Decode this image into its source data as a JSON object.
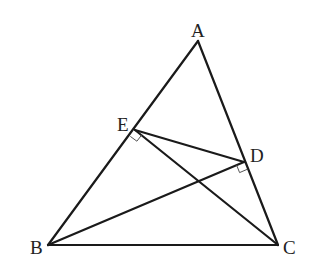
{
  "diagram": {
    "type": "geometry-triangle",
    "points": {
      "A": {
        "label": "A",
        "x": 198,
        "y": 41
      },
      "B": {
        "label": "B",
        "x": 48,
        "y": 245
      },
      "C": {
        "label": "C",
        "x": 278,
        "y": 245
      },
      "D": {
        "label": "D",
        "x": 244,
        "y": 162
      },
      "E": {
        "label": "E",
        "x": 135,
        "y": 130
      }
    },
    "segments": [
      {
        "from": "A",
        "to": "B"
      },
      {
        "from": "A",
        "to": "C"
      },
      {
        "from": "B",
        "to": "C"
      },
      {
        "from": "B",
        "to": "D"
      },
      {
        "from": "C",
        "to": "E"
      },
      {
        "from": "E",
        "to": "D"
      }
    ],
    "right_angles": [
      {
        "at": "E",
        "between": [
          "B",
          "C"
        ],
        "note": "CE ⊥ AB"
      },
      {
        "at": "D",
        "between": [
          "B",
          "C"
        ],
        "note": "BD ⊥ AC"
      }
    ],
    "labels": {
      "A": "A",
      "B": "B",
      "C": "C",
      "D": "D",
      "E": "E"
    },
    "colors": {
      "line": "#1a1a1a",
      "label": "#222222",
      "background": "#ffffff"
    }
  }
}
